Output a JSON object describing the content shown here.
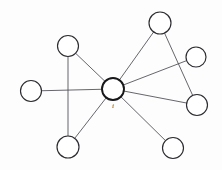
{
  "figure": {
    "name": "star-network-graph",
    "width": 222,
    "height": 170,
    "background_color": "#fdfdfd",
    "edge_color": "#4a4a52",
    "node_stroke_color": "#2b2b30",
    "node_fill_color": "#ffffff",
    "center_node_stroke_color": "#17171a"
  },
  "nodes": [
    {
      "id": "i",
      "label": "i",
      "label_visible": true,
      "cx": 113,
      "cy": 89,
      "r": 11.0,
      "role": "center"
    },
    {
      "id": "n1",
      "label": "",
      "label_visible": false,
      "cx": 31,
      "cy": 91,
      "r": 10.5,
      "role": "neighbor"
    },
    {
      "id": "n2",
      "label": "",
      "label_visible": false,
      "cx": 68,
      "cy": 46,
      "r": 10.5,
      "role": "neighbor"
    },
    {
      "id": "n3",
      "label": "",
      "label_visible": false,
      "cx": 68,
      "cy": 147,
      "r": 11.0,
      "role": "neighbor"
    },
    {
      "id": "n4",
      "label": "",
      "label_visible": false,
      "cx": 160,
      "cy": 23,
      "r": 11.0,
      "role": "neighbor"
    },
    {
      "id": "n5",
      "label": "",
      "label_visible": false,
      "cx": 196,
      "cy": 57,
      "r": 10.0,
      "role": "neighbor"
    },
    {
      "id": "n6",
      "label": "",
      "label_visible": false,
      "cx": 197,
      "cy": 105,
      "r": 10.5,
      "role": "neighbor"
    },
    {
      "id": "n7",
      "label": "",
      "label_visible": false,
      "cx": 173,
      "cy": 148,
      "r": 10.5,
      "role": "neighbor"
    }
  ],
  "edges": [
    {
      "from": "i",
      "to": "n1",
      "kind": "spoke"
    },
    {
      "from": "i",
      "to": "n2",
      "kind": "spoke"
    },
    {
      "from": "i",
      "to": "n3",
      "kind": "spoke"
    },
    {
      "from": "i",
      "to": "n4",
      "kind": "spoke"
    },
    {
      "from": "i",
      "to": "n5",
      "kind": "spoke"
    },
    {
      "from": "i",
      "to": "n6",
      "kind": "spoke"
    },
    {
      "from": "i",
      "to": "n7",
      "kind": "spoke"
    },
    {
      "from": "n2",
      "to": "n3",
      "kind": "link"
    },
    {
      "from": "n4",
      "to": "n6",
      "kind": "link"
    }
  ],
  "labels": {
    "center_label": "i"
  }
}
